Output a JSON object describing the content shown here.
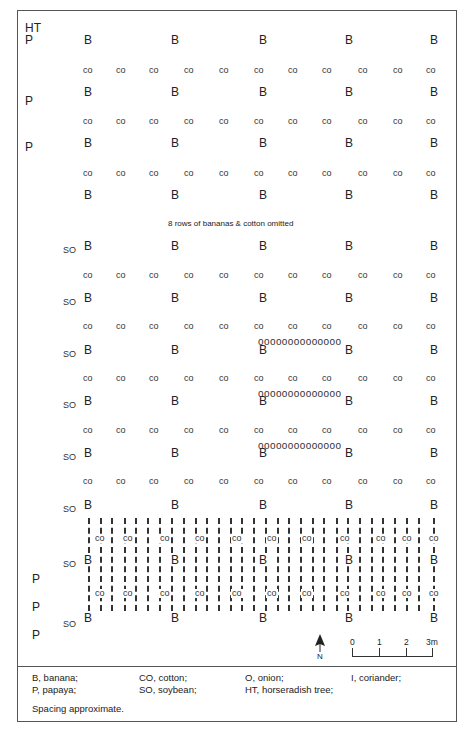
{
  "figure": {
    "corner_label": "HT",
    "omitted_note": "8 rows of bananas  & cotton omitted",
    "symbols": {
      "banana": "B",
      "cotton": "CO",
      "cotton_lower": "co",
      "soybean": "SO",
      "papaya": "P",
      "onion_row": "oooooooooooooo"
    },
    "north_label": "N",
    "scale": {
      "ticks": [
        "0",
        "1",
        "2",
        "3m"
      ]
    }
  },
  "legend": {
    "items": [
      "B, banana;",
      "CO, cotton;",
      "O, onion;",
      "I, coriander;",
      "P, papaya;",
      "SO, soybean;",
      "HT, horseradish tree;"
    ],
    "footnote": "Spacing approximate."
  },
  "layout_data": {
    "banana_columns": 5,
    "cotton_columns": 11,
    "onion_rows": 3,
    "onion_per_row": 14
  }
}
